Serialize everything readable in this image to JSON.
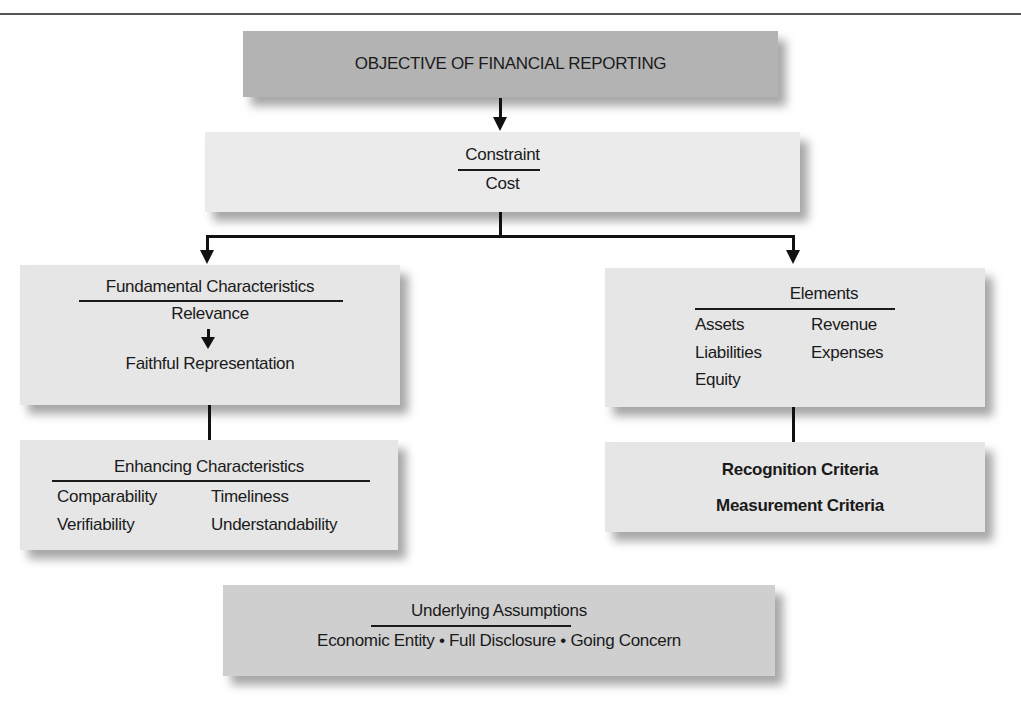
{
  "diagram": {
    "objective": {
      "title": "OBJECTIVE OF FINANCIAL REPORTING"
    },
    "constraint": {
      "heading": "Constraint",
      "items": [
        "Cost"
      ]
    },
    "fundamental": {
      "heading": "Fundamental Characteristics",
      "items": [
        "Relevance",
        "Faithful Representation"
      ],
      "flow_arrow": "Relevance → Faithful Representation"
    },
    "enhancing": {
      "heading": "Enhancing Characteristics",
      "items": [
        "Comparability",
        "Timeliness",
        "Verifiability",
        "Understandability"
      ]
    },
    "elements": {
      "heading": "Elements",
      "items": [
        "Assets",
        "Revenue",
        "Liabilities",
        "Expenses",
        "Equity"
      ]
    },
    "criteria": {
      "items": [
        "Recognition Criteria",
        "Measurement Criteria"
      ]
    },
    "assumptions": {
      "heading": "Underlying Assumptions",
      "text": "Economic Entity • Full Disclosure • Going Concern"
    },
    "colors": {
      "objective_box": "#b3b3b3",
      "constraint_box": "#ebebeb",
      "side_boxes": "#e6e6e6",
      "assumptions_box": "#cfcfcf",
      "lines": "#111111"
    }
  }
}
